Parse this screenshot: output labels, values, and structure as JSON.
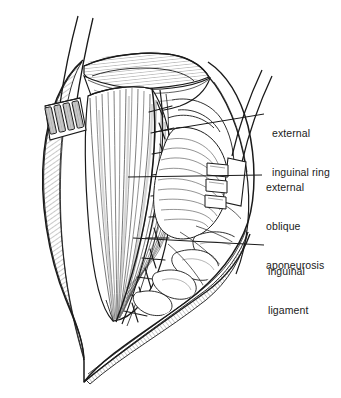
{
  "figure": {
    "type": "line-art anatomical illustration",
    "background_color": "#ffffff",
    "ink_color": "#1a1a1a",
    "shading_color": "#8a8a8a"
  },
  "labels": [
    {
      "id": "external-inguinal-ring",
      "lines": [
        "external",
        "inguinal ring"
      ],
      "line1": "external",
      "line2": "inguinal ring",
      "text_x": 272,
      "text_y": 108,
      "leader": {
        "x1": 264,
        "y1": 114,
        "x2": 155,
        "y2": 132
      }
    },
    {
      "id": "external-oblique-aponeurosis",
      "lines": [
        "external",
        "oblique",
        "aponeurosis"
      ],
      "line1": "external",
      "line2": "oblique",
      "line3": "aponeurosis",
      "text_x": 266,
      "text_y": 155,
      "leader": {
        "x1": 262,
        "y1": 175,
        "x2": 128,
        "y2": 177
      }
    },
    {
      "id": "inguinal-ligament",
      "lines": [
        "inguinal",
        "ligament"
      ],
      "line1": "inguinal",
      "line2": "ligament",
      "text_x": 268,
      "text_y": 239,
      "leader": {
        "x1": 264,
        "y1": 245,
        "x2": 133,
        "y2": 238
      }
    }
  ],
  "structures": {
    "skin_edge": "retracted skin and subcutaneous wound margin",
    "muscle_belly": "internal oblique muscle fibers",
    "suture_line": "interrupted sutures along aponeurosis edge",
    "retractor_left": "four-blade retractor, left wound margin",
    "retractor_right": "three-blade retractor, right wound margin",
    "cord_structures": "spermatic cord and fatty tissue"
  },
  "counts": {
    "left_retractor_blades": 4,
    "right_retractor_blades": 3,
    "sutures": 11
  }
}
